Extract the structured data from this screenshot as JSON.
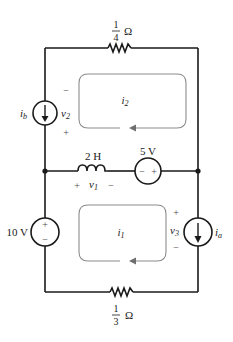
{
  "diagram": {
    "type": "circuit-schematic",
    "components": {
      "resistor_top": {
        "value": "1/4",
        "numerator": "1",
        "denominator": "4",
        "unit": "Ω"
      },
      "resistor_bottom": {
        "value": "1/3",
        "numerator": "1",
        "denominator": "3",
        "unit": "Ω"
      },
      "current_source_b": {
        "label": "i",
        "sub": "b",
        "direction": "down"
      },
      "current_source_a": {
        "label": "i",
        "sub": "a",
        "direction": "down"
      },
      "inductor": {
        "value": "2 H"
      },
      "voltage_source_5v": {
        "value": "5 V",
        "minus": "−",
        "plus": "+"
      },
      "voltage_source_10v": {
        "value": "10 V",
        "plus": "+",
        "minus": "−"
      }
    },
    "voltages": {
      "v1": {
        "label": "v",
        "sub": "1",
        "plus": "+",
        "minus": "−"
      },
      "v2": {
        "label": "v",
        "sub": "2",
        "plus": "+",
        "minus": "−"
      },
      "v3": {
        "label": "v",
        "sub": "3",
        "plus": "+",
        "minus": "−"
      }
    },
    "mesh_currents": {
      "i1": {
        "label": "i",
        "sub": "1",
        "direction": "counterclockwise"
      },
      "i2": {
        "label": "i",
        "sub": "2",
        "direction": "counterclockwise"
      }
    },
    "colors": {
      "wire": "#1a1a1a",
      "loop": "#8c8c8c"
    }
  }
}
